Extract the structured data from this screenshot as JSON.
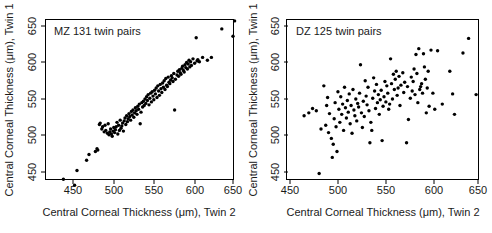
{
  "figure": {
    "width": 492,
    "height": 233,
    "background": "#ffffff",
    "point_color": "#000000",
    "axis_color": "#000000"
  },
  "chart_data": [
    {
      "type": "scatter",
      "title": "MZ 131 twin pairs",
      "xlabel": "Central Corneal Thickness (μm), Twin 2",
      "ylabel": "Central Corneal Thickness (μm), Twin 1",
      "xlim": [
        432,
        655
      ],
      "ylim": [
        428,
        660
      ],
      "xticks": [
        450,
        500,
        550,
        600,
        650
      ],
      "yticks": [
        450,
        500,
        550,
        600,
        650
      ],
      "xtick_labels": [
        "450",
        "500",
        "550",
        "600",
        "650"
      ],
      "ytick_labels": [
        "450",
        "500",
        "550",
        "600",
        "650"
      ],
      "grid": false,
      "legend": null,
      "n_points": 131,
      "x": [
        438,
        455,
        452,
        467,
        470,
        478,
        480,
        481,
        483,
        484,
        486,
        487,
        489,
        490,
        491,
        493,
        494,
        495,
        496,
        497,
        498,
        499,
        500,
        501,
        502,
        503,
        504,
        505,
        506,
        507,
        508,
        509,
        510,
        511,
        512,
        513,
        514,
        515,
        516,
        517,
        518,
        519,
        520,
        521,
        522,
        523,
        524,
        525,
        526,
        527,
        528,
        529,
        530,
        531,
        532,
        533,
        534,
        535,
        536,
        537,
        538,
        539,
        540,
        541,
        542,
        543,
        544,
        545,
        546,
        547,
        548,
        549,
        550,
        551,
        552,
        553,
        554,
        555,
        556,
        557,
        558,
        559,
        560,
        561,
        562,
        563,
        564,
        565,
        566,
        567,
        568,
        569,
        570,
        571,
        572,
        573,
        574,
        575,
        576,
        577,
        578,
        580,
        581,
        582,
        583,
        584,
        585,
        586,
        587,
        588,
        589,
        590,
        591,
        592,
        593,
        594,
        595,
        596,
        597,
        598,
        600,
        602,
        604,
        605,
        606,
        608,
        612,
        618,
        623,
        636,
        650,
        652
      ],
      "y": [
        440,
        452,
        432,
        466,
        474,
        478,
        482,
        480,
        515,
        517,
        509,
        512,
        505,
        514,
        507,
        503,
        516,
        501,
        505,
        509,
        502,
        499,
        506,
        511,
        504,
        508,
        512,
        518,
        502,
        514,
        507,
        521,
        510,
        513,
        517,
        506,
        520,
        524,
        515,
        527,
        519,
        523,
        530,
        526,
        521,
        533,
        528,
        535,
        525,
        531,
        538,
        534,
        529,
        540,
        536,
        543,
        516,
        532,
        545,
        539,
        547,
        541,
        550,
        544,
        553,
        548,
        556,
        542,
        551,
        558,
        546,
        560,
        554,
        549,
        562,
        557,
        565,
        552,
        568,
        561,
        555,
        570,
        564,
        559,
        572,
        566,
        575,
        563,
        578,
        569,
        567,
        580,
        573,
        571,
        576,
        582,
        579,
        574,
        585,
        535,
        577,
        583,
        588,
        581,
        590,
        586,
        584,
        592,
        595,
        589,
        587,
        597,
        593,
        600,
        591,
        598,
        603,
        594,
        601,
        596,
        605,
        599,
        634,
        602,
        604,
        601,
        607,
        603,
        607,
        646,
        636,
        657
      ]
    },
    {
      "type": "scatter",
      "title": "DZ 125 twin pairs",
      "xlabel": "Central Corneal Thickness (μm), Twin 2",
      "ylabel": "Central Corneal Thickness (μm), Twin 1",
      "xlim": [
        455,
        655
      ],
      "ylim": [
        440,
        660
      ],
      "xticks": [
        450,
        500,
        550,
        600,
        650
      ],
      "yticks": [
        450,
        500,
        550,
        600,
        650
      ],
      "xtick_labels": [
        "450",
        "500",
        "550",
        "600",
        "650"
      ],
      "ytick_labels": [
        "450",
        "500",
        "550",
        "600",
        "650"
      ],
      "grid": false,
      "legend": null,
      "n_points": 125,
      "x": [
        465,
        470,
        474,
        478,
        481,
        483,
        486,
        488,
        489,
        490,
        491,
        492,
        494,
        495,
        496,
        497,
        498,
        499,
        500,
        501,
        502,
        503,
        504,
        505,
        506,
        507,
        508,
        509,
        510,
        511,
        512,
        513,
        514,
        515,
        516,
        517,
        518,
        519,
        520,
        521,
        522,
        523,
        524,
        525,
        526,
        527,
        528,
        529,
        530,
        531,
        532,
        533,
        534,
        535,
        536,
        537,
        538,
        539,
        540,
        541,
        542,
        543,
        544,
        545,
        546,
        547,
        548,
        549,
        550,
        551,
        552,
        553,
        554,
        555,
        556,
        557,
        558,
        559,
        560,
        561,
        562,
        563,
        564,
        565,
        566,
        567,
        568,
        570,
        571,
        572,
        574,
        575,
        576,
        578,
        579,
        580,
        581,
        582,
        583,
        584,
        585,
        586,
        587,
        588,
        589,
        590,
        591,
        592,
        593,
        594,
        595,
        596,
        597,
        598,
        600,
        602,
        604,
        607,
        612,
        620,
        623,
        625,
        634,
        640,
        648
      ],
      "y": [
        527,
        531,
        537,
        534,
        448,
        509,
        568,
        514,
        541,
        552,
        504,
        530,
        496,
        470,
        488,
        523,
        545,
        512,
        478,
        560,
        536,
        518,
        553,
        529,
        543,
        507,
        566,
        538,
        524,
        548,
        532,
        557,
        516,
        541,
        503,
        563,
        535,
        527,
        550,
        520,
        544,
        539,
        558,
        597,
        531,
        511,
        547,
        526,
        575,
        554,
        542,
        566,
        534,
        490,
        518,
        507,
        551,
        579,
        561,
        537,
        570,
        545,
        556,
        529,
        549,
        562,
        493,
        540,
        553,
        574,
        546,
        568,
        558,
        536,
        543,
        605,
        571,
        550,
        584,
        563,
        577,
        588,
        555,
        565,
        581,
        541,
        569,
        586,
        559,
        573,
        490,
        567,
        522,
        551,
        580,
        561,
        574,
        591,
        556,
        611,
        585,
        545,
        619,
        563,
        567,
        571,
        558,
        612,
        594,
        577,
        531,
        565,
        588,
        540,
        617,
        558,
        536,
        616,
        543,
        588,
        557,
        529,
        613,
        633,
        556
      ]
    }
  ]
}
